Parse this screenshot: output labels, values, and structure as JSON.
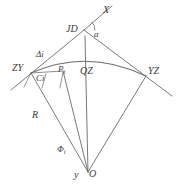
{
  "figure": {
    "type": "geometry-diagram",
    "background_color": "#ffffff",
    "line_color": "#6b6b6b",
    "label_color": "#3a3a3a"
  },
  "labels": {
    "jd": "JD",
    "x": "X",
    "angle_a": "a",
    "delta_i": "Δi",
    "zy": "ZY",
    "ci": "Ci",
    "pi": "P",
    "pi_sub": "i",
    "qz": "QZ",
    "yz": "YZ",
    "r": "R",
    "phi": "Φ",
    "phi_sub": "i",
    "y": "y",
    "o": "O"
  },
  "geometry": {
    "points": {
      "JD": [
        84,
        30
      ],
      "X_end": [
        112,
        6
      ],
      "ZY": [
        31,
        73
      ],
      "YZ": [
        146,
        76
      ],
      "QZ_point": [
        88,
        67
      ],
      "Ci": [
        46,
        73
      ],
      "Pi": [
        63,
        71
      ],
      "O": [
        88,
        172
      ],
      "tangent_left_end": [
        11,
        90
      ],
      "tangent_right_end": [
        172,
        96
      ]
    },
    "arc": {
      "from": "ZY",
      "to": "YZ",
      "apex": [
        88,
        67
      ]
    },
    "radii": [
      {
        "name": "R-left",
        "from": "ZY",
        "to": "O"
      },
      {
        "name": "R-pi",
        "from": "Pi",
        "to": "O"
      },
      {
        "name": "R-qz",
        "from": "QZ",
        "to": "O"
      },
      {
        "name": "R-right",
        "from": "YZ",
        "to": "O"
      }
    ]
  }
}
